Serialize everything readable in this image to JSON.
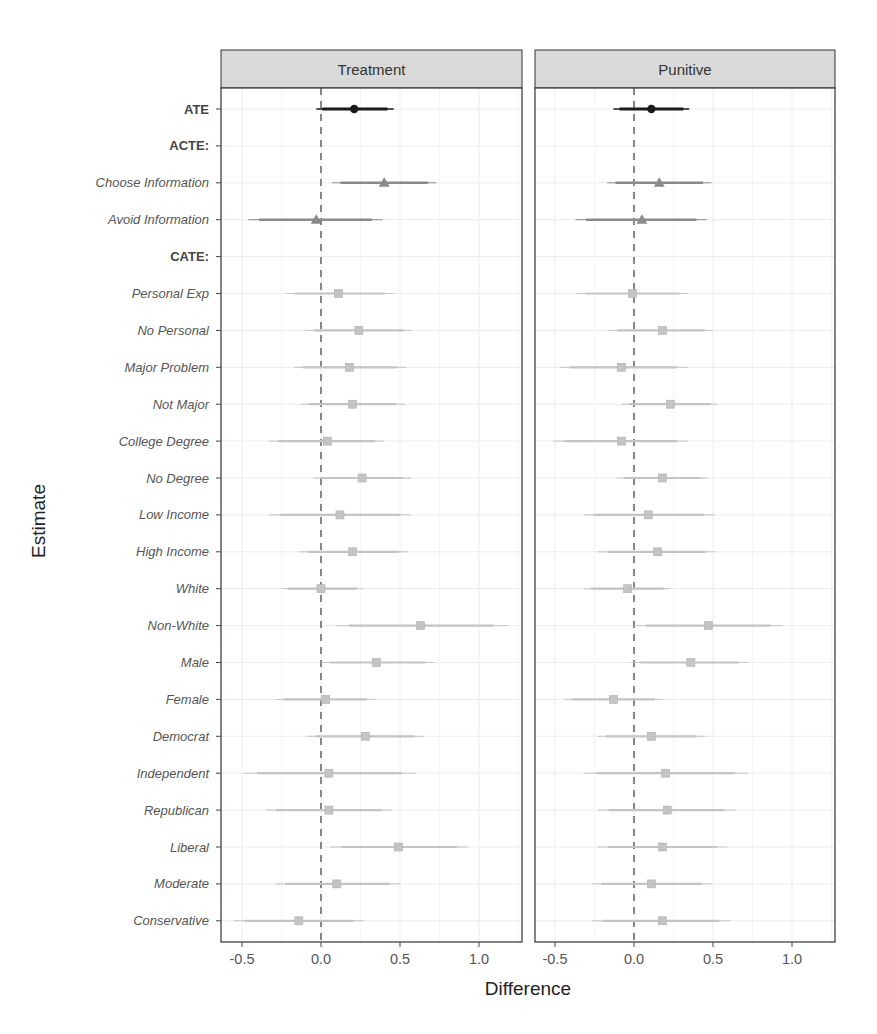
{
  "chart_data": {
    "type": "forest",
    "xlabel": "Difference",
    "ylabel": "Estimate",
    "xlim": [
      -0.62,
      1.28
    ],
    "x_ticks": [
      "-0.5",
      "0.0",
      "0.5",
      "1.0"
    ],
    "x_tick_values": [
      -0.5,
      0.0,
      0.5,
      1.0
    ],
    "reference_line": 0.0,
    "grid": true,
    "panels": [
      "Treatment",
      "Punitive"
    ],
    "rows": [
      {
        "label": "ATE",
        "style": "bold",
        "marker": "circle",
        "group": "ATE"
      },
      {
        "label": "ACTE:",
        "style": "bold",
        "marker": "none",
        "group": "header"
      },
      {
        "label": "Choose Information",
        "style": "italic",
        "marker": "triangle",
        "group": "ACTE"
      },
      {
        "label": "Avoid Information",
        "style": "italic",
        "marker": "triangle",
        "group": "ACTE"
      },
      {
        "label": "CATE:",
        "style": "bold",
        "marker": "none",
        "group": "header"
      },
      {
        "label": "Personal Exp",
        "style": "italic",
        "marker": "square",
        "group": "CATE"
      },
      {
        "label": "No Personal",
        "style": "italic",
        "marker": "square",
        "group": "CATE"
      },
      {
        "label": "Major Problem",
        "style": "italic",
        "marker": "square",
        "group": "CATE"
      },
      {
        "label": "Not Major",
        "style": "italic",
        "marker": "square",
        "group": "CATE"
      },
      {
        "label": "College Degree",
        "style": "italic",
        "marker": "square",
        "group": "CATE"
      },
      {
        "label": "No Degree",
        "style": "italic",
        "marker": "square",
        "group": "CATE"
      },
      {
        "label": "Low Income",
        "style": "italic",
        "marker": "square",
        "group": "CATE"
      },
      {
        "label": "High Income",
        "style": "italic",
        "marker": "square",
        "group": "CATE"
      },
      {
        "label": "White",
        "style": "italic",
        "marker": "square",
        "group": "CATE"
      },
      {
        "label": "Non-White",
        "style": "italic",
        "marker": "square",
        "group": "CATE"
      },
      {
        "label": "Male",
        "style": "italic",
        "marker": "square",
        "group": "CATE"
      },
      {
        "label": "Female",
        "style": "italic",
        "marker": "square",
        "group": "CATE"
      },
      {
        "label": "Democrat",
        "style": "italic",
        "marker": "square",
        "group": "CATE"
      },
      {
        "label": "Independent",
        "style": "italic",
        "marker": "square",
        "group": "CATE"
      },
      {
        "label": "Republican",
        "style": "italic",
        "marker": "square",
        "group": "CATE"
      },
      {
        "label": "Liberal",
        "style": "italic",
        "marker": "square",
        "group": "CATE"
      },
      {
        "label": "Moderate",
        "style": "italic",
        "marker": "square",
        "group": "CATE"
      },
      {
        "label": "Conservative",
        "style": "italic",
        "marker": "square",
        "group": "CATE"
      }
    ],
    "series": [
      {
        "name": "Treatment",
        "estimates": [
          0.21,
          null,
          0.4,
          -0.03,
          null,
          0.11,
          0.24,
          0.18,
          0.2,
          0.04,
          0.26,
          0.12,
          0.2,
          0.0,
          0.63,
          0.35,
          0.03,
          0.28,
          0.05,
          0.05,
          0.49,
          0.1,
          -0.14
        ],
        "lower": [
          -0.03,
          null,
          0.07,
          -0.46,
          null,
          -0.22,
          -0.1,
          -0.17,
          -0.13,
          -0.33,
          -0.05,
          -0.33,
          -0.14,
          -0.25,
          0.09,
          0.0,
          -0.29,
          -0.09,
          -0.49,
          -0.35,
          0.06,
          -0.29,
          -0.55
        ],
        "upper": [
          0.46,
          null,
          0.73,
          0.39,
          null,
          0.46,
          0.58,
          0.54,
          0.53,
          0.4,
          0.57,
          0.57,
          0.55,
          0.27,
          1.18,
          0.72,
          0.34,
          0.65,
          0.6,
          0.45,
          0.93,
          0.5,
          0.27
        ]
      },
      {
        "name": "Punitive",
        "estimates": [
          0.11,
          null,
          0.16,
          0.05,
          null,
          -0.01,
          0.18,
          -0.08,
          0.23,
          -0.08,
          0.18,
          0.09,
          0.15,
          -0.04,
          0.47,
          0.36,
          -0.13,
          0.11,
          0.2,
          0.21,
          0.18,
          0.11,
          0.18
        ],
        "lower": [
          -0.13,
          null,
          -0.17,
          -0.37,
          null,
          -0.36,
          -0.16,
          -0.47,
          -0.08,
          -0.51,
          -0.11,
          -0.32,
          -0.23,
          -0.32,
          0.0,
          -0.02,
          -0.44,
          -0.23,
          -0.32,
          -0.23,
          -0.23,
          -0.27,
          -0.27
        ],
        "upper": [
          0.35,
          null,
          0.49,
          0.46,
          null,
          0.34,
          0.5,
          0.34,
          0.53,
          0.34,
          0.47,
          0.51,
          0.51,
          0.23,
          0.94,
          0.72,
          0.18,
          0.45,
          0.72,
          0.64,
          0.59,
          0.49,
          0.61
        ]
      }
    ],
    "colors": {
      "ATE": "#1a1a1a",
      "ACTE": "#8a8a8a",
      "CATE": "#c4c4c4",
      "strip_bg": "#d9d9d9",
      "panel_border": "#333333",
      "grid": "#ececec",
      "ref_line": "#6b6b6b"
    }
  }
}
